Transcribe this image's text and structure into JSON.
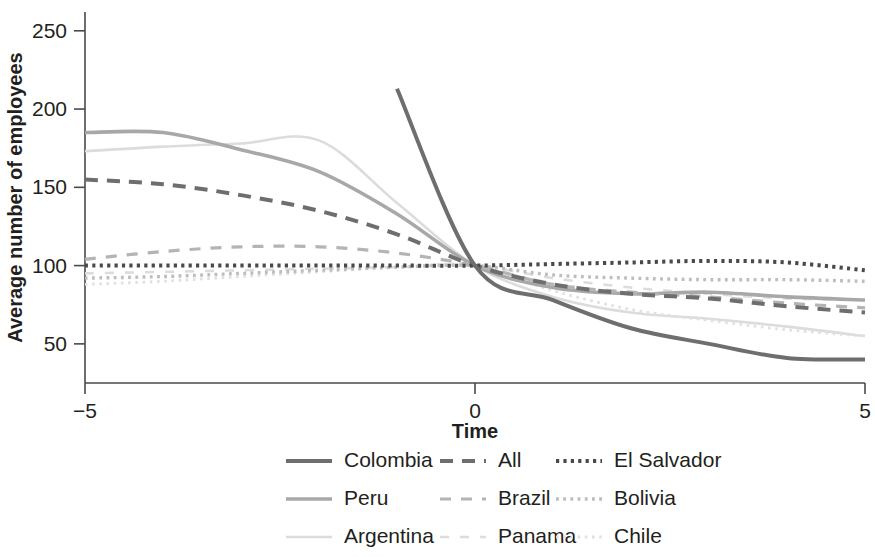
{
  "chart_data": {
    "type": "line",
    "title": "",
    "xlabel": "Time",
    "ylabel": "Average number of employees",
    "xlim": [
      -5,
      5
    ],
    "ylim": [
      25,
      262
    ],
    "xticks": [
      -5,
      0,
      5
    ],
    "xticklabels": [
      "−5",
      "0",
      "5"
    ],
    "yticks": [
      50,
      100,
      150,
      200,
      250
    ],
    "yticklabels": [
      "50",
      "100",
      "150",
      "200",
      "250"
    ],
    "grid": false,
    "legend_position": "bottom",
    "legend_columns": 3,
    "x": [
      -5,
      -4,
      -3,
      -2,
      -1,
      0,
      1,
      2,
      3,
      4,
      5
    ],
    "series": [
      {
        "name": "Colombia",
        "style": "solid",
        "color": "#6e6e6e",
        "width": 4.0,
        "x": [
          -1,
          0,
          1,
          2,
          3,
          4,
          5
        ],
        "values": [
          213,
          100,
          78,
          60,
          50,
          41,
          40
        ]
      },
      {
        "name": "Peru",
        "style": "solid",
        "color": "#a8a8a8",
        "width": 3.6,
        "x": [
          -5,
          -4,
          -3,
          -2,
          -1,
          0,
          1,
          2,
          3,
          4,
          5
        ],
        "values": [
          185,
          185,
          174,
          160,
          133,
          100,
          86,
          82,
          83,
          80,
          78
        ]
      },
      {
        "name": "Argentina",
        "style": "solid",
        "color": "#dcdcdc",
        "width": 2.6,
        "x": [
          -5,
          -4,
          -3,
          -2,
          -1,
          0,
          1,
          2,
          3,
          4,
          5
        ],
        "values": [
          173,
          176,
          178,
          180,
          140,
          100,
          80,
          70,
          66,
          61,
          55
        ]
      },
      {
        "name": "All",
        "style": "dashed",
        "color": "#6e6e6e",
        "width": 4.0,
        "dash": "13 9",
        "x": [
          -5,
          -4,
          -3,
          -2,
          -1,
          0,
          1,
          2,
          3,
          4,
          5
        ],
        "values": [
          155,
          152,
          145,
          135,
          120,
          100,
          88,
          82,
          79,
          74,
          70
        ]
      },
      {
        "name": "Brazil",
        "style": "dashed",
        "color": "#b4b4b4",
        "width": 3.2,
        "dash": "11 10",
        "x": [
          -5,
          -4,
          -3,
          -2,
          -1,
          0,
          1,
          2,
          3,
          4,
          5
        ],
        "values": [
          104,
          109,
          112,
          112,
          108,
          100,
          88,
          83,
          80,
          76,
          73
        ]
      },
      {
        "name": "Panama",
        "style": "dashed",
        "color": "#dcdcdc",
        "width": 2.6,
        "dash": "9 11",
        "x": [
          -5,
          -4,
          -3,
          -2,
          -1,
          0,
          1,
          2,
          3,
          4,
          5
        ],
        "values": [
          95,
          96,
          97,
          98,
          99,
          100,
          92,
          86,
          82,
          79,
          78
        ]
      },
      {
        "name": "El Salvador",
        "style": "dotted",
        "color": "#4a4a4a",
        "width": 4.0,
        "dash": "3.2 4.2",
        "x": [
          -5,
          -4,
          -3,
          -2,
          -1,
          0,
          1,
          2,
          3,
          4,
          5
        ],
        "values": [
          100,
          100,
          100,
          100,
          100,
          100,
          101,
          102,
          103,
          102,
          97
        ]
      },
      {
        "name": "Bolivia",
        "style": "dotted",
        "color": "#bdbdbd",
        "width": 3.4,
        "dash": "2.8 4.4",
        "x": [
          -5,
          -4,
          -3,
          -2,
          -1,
          0,
          1,
          2,
          3,
          4,
          5
        ],
        "values": [
          92,
          93,
          95,
          97,
          99,
          100,
          94,
          92,
          91,
          91,
          90
        ]
      },
      {
        "name": "Chile",
        "style": "dotted",
        "color": "#e0e0e0",
        "width": 2.8,
        "dash": "2.6 4.6",
        "x": [
          -5,
          -4,
          -3,
          -2,
          -1,
          0,
          1,
          2,
          3,
          4,
          5
        ],
        "values": [
          88,
          90,
          93,
          96,
          99,
          100,
          84,
          72,
          65,
          59,
          55
        ]
      }
    ],
    "legend": [
      [
        {
          "name": "Colombia",
          "style": "solid",
          "color": "#6e6e6e",
          "width": 4.0,
          "dash": ""
        },
        {
          "name": "All",
          "style": "dashed",
          "color": "#6e6e6e",
          "width": 4.0,
          "dash": "13 9"
        },
        {
          "name": "El Salvador",
          "style": "dotted",
          "color": "#4a4a4a",
          "width": 4.0,
          "dash": "3.2 4.2"
        }
      ],
      [
        {
          "name": "Peru",
          "style": "solid",
          "color": "#a8a8a8",
          "width": 3.6,
          "dash": ""
        },
        {
          "name": "Brazil",
          "style": "dashed",
          "color": "#b4b4b4",
          "width": 3.2,
          "dash": "11 10"
        },
        {
          "name": "Bolivia",
          "style": "dotted",
          "color": "#bdbdbd",
          "width": 3.4,
          "dash": "2.8 4.4"
        }
      ],
      [
        {
          "name": "Argentina",
          "style": "solid",
          "color": "#dcdcdc",
          "width": 2.6,
          "dash": ""
        },
        {
          "name": "Panama",
          "style": "dashed",
          "color": "#dcdcdc",
          "width": 2.6,
          "dash": "9 11"
        },
        {
          "name": "Chile",
          "style": "dotted",
          "color": "#e0e0e0",
          "width": 2.8,
          "dash": "2.6 4.6"
        }
      ]
    ]
  }
}
